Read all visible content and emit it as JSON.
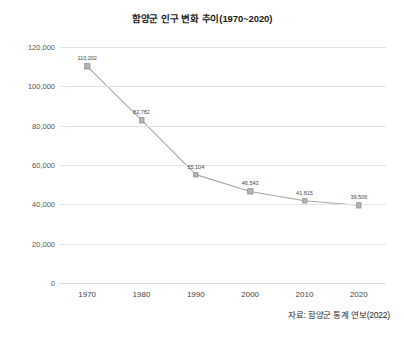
{
  "chart_data": {
    "type": "line",
    "title": "함양군 인구 변화 추이(1970~2020)",
    "xlabel": "",
    "ylabel": "",
    "categories": [
      "1970",
      "1980",
      "1990",
      "2000",
      "2010",
      "2020"
    ],
    "values": [
      110202,
      82782,
      55104,
      46543,
      41815,
      39506
    ],
    "point_labels": [
      "110,202",
      "82,782",
      "55,104",
      "46,543",
      "41,815",
      "39,506"
    ],
    "series": [
      {
        "name": "함양군 인구",
        "values": [
          110202,
          82782,
          55104,
          46543,
          41815,
          39506
        ]
      }
    ],
    "ylim": [
      0,
      120000
    ],
    "y_ticks": [
      0,
      20000,
      40000,
      60000,
      80000,
      100000,
      120000
    ],
    "y_tick_labels": [
      "0",
      "20,000",
      "40,000",
      "60,000",
      "80,000",
      "100,000",
      "120,000"
    ],
    "x_tick_labels": [
      "1970",
      "1980",
      "1990",
      "2000",
      "2010",
      "2020"
    ],
    "grid": true,
    "legend": false,
    "line_color": "#a8a8a8",
    "marker_color": "#b9b9b9",
    "grid_color": "#e4e4e4",
    "text_color": "#333333"
  },
  "source": {
    "note": "자료: 함양군 통계 연보(2022)"
  }
}
